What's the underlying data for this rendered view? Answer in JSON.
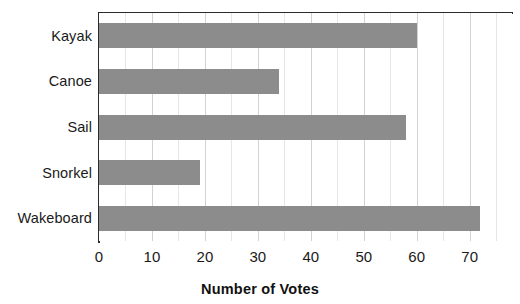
{
  "chart_data": {
    "type": "bar",
    "orientation": "horizontal",
    "title": "",
    "xlabel": "Number of Votes",
    "ylabel": "",
    "categories": [
      "Kayak",
      "Canoe",
      "Sail",
      "Snorkel",
      "Wakeboard"
    ],
    "values": [
      60,
      34,
      58,
      19,
      72
    ],
    "xlim": [
      0,
      78
    ],
    "xticks": [
      0,
      10,
      20,
      30,
      40,
      50,
      60,
      70
    ],
    "xtick_labels": [
      "0",
      "10",
      "20",
      "30",
      "40",
      "50",
      "60",
      "70"
    ],
    "minor_tick_step": 5,
    "grid": true,
    "legend": false,
    "bar_color": "#8c8c8c",
    "axis_color": "#2b2b2b",
    "gridline_color": "#e6e6e6",
    "background": "#ffffff"
  }
}
